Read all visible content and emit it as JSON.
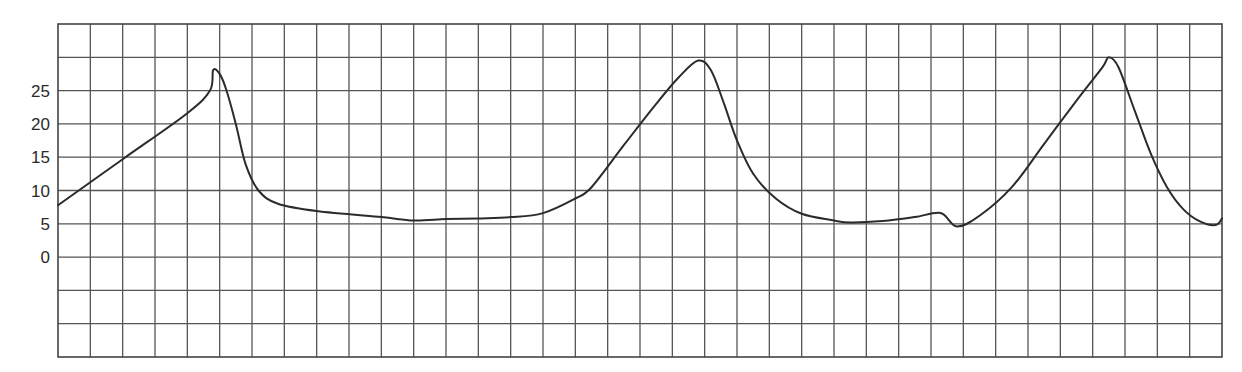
{
  "chart_data": {
    "type": "line",
    "title": "",
    "xlabel": "",
    "ylabel": "",
    "ylim": [
      -15,
      35
    ],
    "y_ticks": [
      {
        "label": "25",
        "value": 25
      },
      {
        "label": "20",
        "value": 20
      },
      {
        "label": "15",
        "value": 15
      },
      {
        "label": "10",
        "value": 10
      },
      {
        "label": "5",
        "value": 5
      },
      {
        "label": "0",
        "value": 0
      }
    ],
    "x_grid_columns": 36,
    "y_grid_rows": 10,
    "grid": true,
    "legend": null,
    "series": [
      {
        "name": "waveform",
        "color": "#2b2b2b",
        "points": [
          [
            0.0,
            7.8
          ],
          [
            2.0,
            14.7
          ],
          [
            4.0,
            21.6
          ],
          [
            4.7,
            25.0
          ],
          [
            4.8,
            28.1
          ],
          [
            5.0,
            27.5
          ],
          [
            5.2,
            25.2
          ],
          [
            5.5,
            20.0
          ],
          [
            5.8,
            14.0
          ],
          [
            6.2,
            10.0
          ],
          [
            6.8,
            8.0
          ],
          [
            8.0,
            6.9
          ],
          [
            10.0,
            6.0
          ],
          [
            11.0,
            5.5
          ],
          [
            12.0,
            5.7
          ],
          [
            13.0,
            5.8
          ],
          [
            14.0,
            6.0
          ],
          [
            15.0,
            6.6
          ],
          [
            16.0,
            8.8
          ],
          [
            16.5,
            10.5
          ],
          [
            17.5,
            16.8
          ],
          [
            18.5,
            23.0
          ],
          [
            19.2,
            27.0
          ],
          [
            19.8,
            29.5
          ],
          [
            20.2,
            28.0
          ],
          [
            20.6,
            23.0
          ],
          [
            21.0,
            17.5
          ],
          [
            21.5,
            12.5
          ],
          [
            22.2,
            8.8
          ],
          [
            23.0,
            6.5
          ],
          [
            24.0,
            5.5
          ],
          [
            24.5,
            5.2
          ],
          [
            25.5,
            5.4
          ],
          [
            26.5,
            6.0
          ],
          [
            27.3,
            6.6
          ],
          [
            27.8,
            4.6
          ],
          [
            28.5,
            6.2
          ],
          [
            29.5,
            10.5
          ],
          [
            30.5,
            17.0
          ],
          [
            31.5,
            23.5
          ],
          [
            32.3,
            28.5
          ],
          [
            32.5,
            30.0
          ],
          [
            32.8,
            28.5
          ],
          [
            33.3,
            22.0
          ],
          [
            33.8,
            15.5
          ],
          [
            34.3,
            10.5
          ],
          [
            34.8,
            7.2
          ],
          [
            35.3,
            5.4
          ],
          [
            35.8,
            4.8
          ],
          [
            36.5,
            5.0
          ],
          [
            37.0,
            5.4
          ],
          [
            36.0,
            5.8
          ]
        ]
      }
    ]
  }
}
